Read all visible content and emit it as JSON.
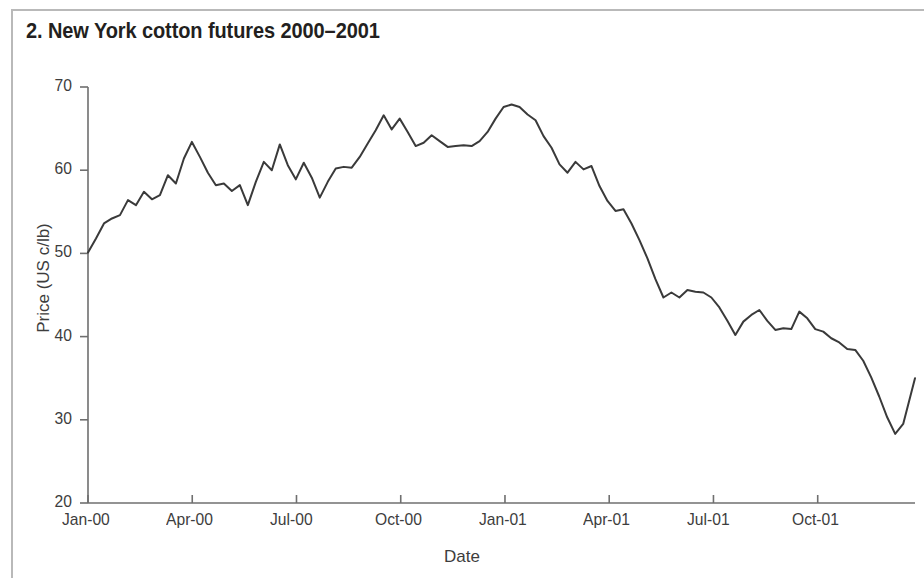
{
  "figure": {
    "number": "2.",
    "title": "2. New York cotton futures 2000–2001",
    "frame_color": "#b9b9b9",
    "background": "#ffffff"
  },
  "chart_data": {
    "type": "line",
    "title": "2. New York cotton futures 2000–2001",
    "xlabel": "Date",
    "ylabel": "Price (US c/lb)",
    "ylim": [
      20,
      70
    ],
    "ytick_labels": [
      "20",
      "30",
      "40",
      "50",
      "60",
      "70"
    ],
    "ytick_values": [
      20,
      30,
      40,
      50,
      60,
      70
    ],
    "xtick_labels": [
      "Jan-00",
      "Apr-00",
      "Jul-00",
      "Oct-00",
      "Jan-01",
      "Apr-01",
      "Jul-01",
      "Oct-01"
    ],
    "xtick_months": [
      0,
      3,
      6,
      9,
      12,
      15,
      18,
      21
    ],
    "xlim_months": [
      0,
      23.8
    ],
    "grid": false,
    "legend": null,
    "line_color": "#3a3a3a",
    "line_width": 2,
    "units": "US cents per pound",
    "series": [
      {
        "name": "New York cotton futures",
        "x_months": [
          0,
          0.23,
          0.46,
          0.69,
          0.92,
          1.15,
          1.38,
          1.61,
          1.84,
          2.07,
          2.3,
          2.53,
          2.76,
          2.99,
          3.22,
          3.45,
          3.68,
          3.91,
          4.14,
          4.37,
          4.6,
          4.83,
          5.06,
          5.29,
          5.52,
          5.75,
          5.98,
          6.21,
          6.44,
          6.67,
          6.9,
          7.13,
          7.36,
          7.59,
          7.82,
          8.05,
          8.28,
          8.51,
          8.74,
          8.97,
          9.2,
          9.43,
          9.66,
          9.89,
          10.12,
          10.35,
          10.58,
          10.81,
          11.04,
          11.27,
          11.5,
          11.73,
          11.96,
          12.19,
          12.42,
          12.65,
          12.88,
          13.11,
          13.34,
          13.57,
          13.8,
          14.03,
          14.26,
          14.49,
          14.72,
          14.95,
          15.18,
          15.41,
          15.64,
          15.87,
          16.1,
          16.33,
          16.56,
          16.79,
          17.02,
          17.25,
          17.48,
          17.71,
          17.94,
          18.17,
          18.4,
          18.63,
          18.86,
          19.09,
          19.32,
          19.55,
          19.78,
          20.01,
          20.24,
          20.47,
          20.7,
          20.93,
          21.16,
          21.39,
          21.62,
          21.85,
          22.08,
          22.31,
          22.54,
          22.77,
          23.0,
          23.23,
          23.46,
          23.8
        ],
        "values": [
          50.1,
          51.8,
          53.6,
          54.2,
          54.6,
          56.4,
          55.8,
          57.4,
          56.5,
          57.0,
          59.4,
          58.4,
          61.4,
          63.4,
          61.6,
          59.7,
          58.2,
          58.4,
          57.5,
          58.2,
          55.8,
          58.6,
          61.0,
          60.0,
          63.1,
          60.6,
          58.9,
          60.9,
          59.1,
          56.7,
          58.6,
          60.2,
          60.4,
          60.3,
          61.6,
          63.2,
          64.8,
          66.6,
          64.9,
          66.2,
          64.6,
          62.9,
          63.3,
          64.2,
          63.5,
          62.8,
          62.9,
          63.0,
          62.9,
          63.5,
          64.6,
          66.2,
          67.6,
          67.9,
          67.6,
          66.7,
          66.0,
          64.1,
          62.7,
          60.7,
          59.7,
          61.0,
          60.1,
          60.5,
          58.1,
          56.3,
          55.1,
          55.3,
          53.6,
          51.6,
          49.4,
          46.9,
          44.7,
          45.3,
          44.7,
          45.6,
          45.4,
          45.3,
          44.7,
          43.5,
          41.9,
          40.2,
          41.8,
          42.6,
          43.2,
          41.9,
          40.8,
          41.0,
          40.9,
          43.0,
          42.2,
          40.9,
          40.6,
          39.8,
          39.3,
          38.5,
          38.4,
          37.1,
          35.1,
          32.8,
          30.3,
          28.3,
          29.5,
          35.0
        ]
      }
    ],
    "notes": {
      "start_value": 50.1,
      "peak_value": 67.9,
      "peak_date": "Dec-00",
      "trough_value": 28.3,
      "trough_date": "Oct-01",
      "end_value": 35.0
    }
  }
}
